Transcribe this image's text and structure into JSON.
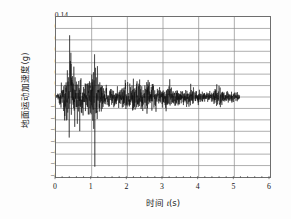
{
  "chart_data": {
    "type": "line",
    "title": "",
    "xlabel": "时间 t(s)",
    "xlabel_prefix": "时间 ",
    "xlabel_var": "t",
    "xlabel_unit": "(s)",
    "ylabel": "地面运动加速度(g)",
    "xlim": [
      0,
      6
    ],
    "ylim": [
      -0.14,
      0.14
    ],
    "xticks": [
      0,
      1,
      2,
      3,
      4,
      5,
      6
    ],
    "xtick_labels": [
      "0",
      "1",
      "2",
      "3",
      "4",
      "5",
      "6"
    ],
    "x_minor_ticks_per_interval": 5,
    "yticks": [
      0.14,
      0.12,
      0.1,
      0.08,
      0.06,
      0.04,
      0.02,
      0.0,
      -0.02,
      -0.04,
      -0.06,
      -0.08,
      -0.1,
      -0.12,
      -0.14
    ],
    "ytick_labels": [
      "0.14",
      "0.12",
      "0.10",
      "0.08",
      "0.06",
      "0.04",
      "0.02",
      "0.00",
      "-0.02",
      "-0.04",
      "-0.06",
      "-0.08",
      "-0.10",
      "-0.12",
      "-0.14"
    ],
    "grid": {
      "horizontal": true,
      "horizontal_step": 0.02,
      "vertical": true,
      "vertical_step": 1,
      "color": "#8c8c8c"
    },
    "legend": null,
    "series_name": "ground motion acceleration time history",
    "line_color": "#111111",
    "line_width": 0.5,
    "data_extent": {
      "t_start": 0.0,
      "t_end": 5.15,
      "max_positive_peak": 0.108,
      "max_positive_peak_time": 0.38,
      "max_negative_peak": -0.122,
      "max_negative_peak_time": 1.09,
      "mean": 0.0
    },
    "envelope_description": "Random seismic accelerogram: rapid build-up before 0.3 s, strongest shaking 0.3-1.2 s with peaks to +0.108 g and -0.122 g, moderate sustained shaking 1.2-3.0 g-range +/-0.04 g, gradual decay to +/-0.015 g by 5.1 s.",
    "envelope": [
      {
        "t": 0.0,
        "amp": 0.004
      },
      {
        "t": 0.08,
        "amp": 0.022
      },
      {
        "t": 0.18,
        "amp": 0.04
      },
      {
        "t": 0.3,
        "amp": 0.062
      },
      {
        "t": 0.38,
        "amp": 0.108
      },
      {
        "t": 0.46,
        "amp": 0.082
      },
      {
        "t": 0.58,
        "amp": 0.06
      },
      {
        "t": 0.7,
        "amp": 0.058
      },
      {
        "t": 0.84,
        "amp": 0.048
      },
      {
        "t": 0.96,
        "amp": 0.06
      },
      {
        "t": 1.04,
        "amp": 0.072
      },
      {
        "t": 1.1,
        "amp": 0.122
      },
      {
        "t": 1.2,
        "amp": 0.056
      },
      {
        "t": 1.35,
        "amp": 0.034
      },
      {
        "t": 1.55,
        "amp": 0.03
      },
      {
        "t": 1.75,
        "amp": 0.034
      },
      {
        "t": 1.95,
        "amp": 0.042
      },
      {
        "t": 2.1,
        "amp": 0.038
      },
      {
        "t": 2.25,
        "amp": 0.054
      },
      {
        "t": 2.4,
        "amp": 0.04
      },
      {
        "t": 2.55,
        "amp": 0.044
      },
      {
        "t": 2.75,
        "amp": 0.032
      },
      {
        "t": 2.95,
        "amp": 0.028
      },
      {
        "t": 3.1,
        "amp": 0.026
      },
      {
        "t": 3.22,
        "amp": 0.032
      },
      {
        "t": 3.4,
        "amp": 0.024
      },
      {
        "t": 3.6,
        "amp": 0.022
      },
      {
        "t": 3.78,
        "amp": 0.034
      },
      {
        "t": 3.95,
        "amp": 0.022
      },
      {
        "t": 4.15,
        "amp": 0.018
      },
      {
        "t": 4.35,
        "amp": 0.018
      },
      {
        "t": 4.55,
        "amp": 0.028
      },
      {
        "t": 4.75,
        "amp": 0.016
      },
      {
        "t": 4.95,
        "amp": 0.015
      },
      {
        "t": 5.15,
        "amp": 0.012
      }
    ]
  }
}
